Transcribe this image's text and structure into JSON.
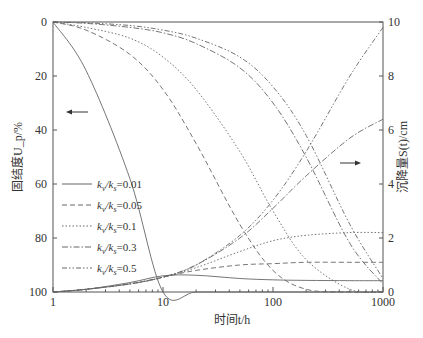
{
  "chart_data": {
    "type": "line",
    "title": "",
    "xlabel": "时间t/h",
    "ylabel_left": "固结度U_p/%",
    "ylabel_right": "沉降量S(t)/cm",
    "xscale": "log",
    "xlim": [
      1,
      1000
    ],
    "ylim_left": [
      100,
      0
    ],
    "ylim_right": [
      0,
      10
    ],
    "left_axis_inverted": true,
    "x_ticks": [
      "1",
      "10",
      "100",
      "1000"
    ],
    "y_left_ticks": [
      "0",
      "20",
      "40",
      "60",
      "80",
      "100"
    ],
    "y_right_ticks": [
      "0",
      "2",
      "4",
      "6",
      "8",
      "10"
    ],
    "grid": false,
    "legend_position": "left-middle",
    "annotations": [
      {
        "text": "←",
        "meaning": "left-pointing arrow: descending curves read on left axis (consolidation degree)"
      },
      {
        "text": "→",
        "meaning": "right-pointing arrow: rising curves read on right axis (settlement)"
      }
    ],
    "x": [
      1,
      2,
      5,
      10,
      20,
      50,
      100,
      200,
      500,
      1000
    ],
    "series": [
      {
        "name": "k_v/k_s=0.01",
        "axis": "left",
        "style": "solid",
        "values": [
          0,
          18,
          58,
          100,
          100,
          100,
          100,
          100,
          100,
          100
        ]
      },
      {
        "name": "k_v/k_s=0.05",
        "axis": "left",
        "style": "dashed",
        "values": [
          0,
          3,
          12,
          25,
          45,
          75,
          92,
          99,
          100,
          100
        ]
      },
      {
        "name": "k_v/k_s=0.1",
        "axis": "left",
        "style": "dotted",
        "values": [
          0,
          2,
          6,
          13,
          25,
          48,
          70,
          88,
          99,
          100
        ]
      },
      {
        "name": "k_v/k_s=0.3",
        "axis": "left",
        "style": "dash-dot",
        "values": [
          0,
          0.5,
          2,
          4,
          8,
          17,
          30,
          50,
          82,
          97
        ]
      },
      {
        "name": "k_v/k_s=0.5",
        "axis": "left",
        "style": "dash-dot-dot",
        "values": [
          0,
          0.3,
          1.3,
          3,
          6,
          13,
          24,
          42,
          75,
          95
        ]
      },
      {
        "name": "k_v/k_s=0.01 settlement",
        "axis": "right",
        "style": "solid",
        "values": [
          0,
          0.1,
          0.35,
          0.6,
          0.62,
          0.5,
          0.45,
          0.43,
          0.42,
          0.42
        ]
      },
      {
        "name": "k_v/k_s=0.05 settlement",
        "axis": "right",
        "style": "dashed",
        "values": [
          0,
          0.1,
          0.3,
          0.55,
          0.8,
          1.0,
          1.05,
          1.1,
          1.1,
          1.1
        ]
      },
      {
        "name": "k_v/k_s=0.1 settlement",
        "axis": "right",
        "style": "dotted",
        "values": [
          0,
          0.1,
          0.3,
          0.55,
          0.9,
          1.5,
          1.9,
          2.1,
          2.2,
          2.2
        ]
      },
      {
        "name": "k_v/k_s=0.3 settlement",
        "axis": "right",
        "style": "dash-dot",
        "values": [
          0,
          0.1,
          0.3,
          0.55,
          1.0,
          2.0,
          3.1,
          4.3,
          5.7,
          6.4
        ]
      },
      {
        "name": "k_v/k_s=0.5 settlement",
        "axis": "right",
        "style": "dash-dot-dot",
        "values": [
          0,
          0.1,
          0.3,
          0.55,
          1.0,
          2.1,
          3.4,
          5.2,
          8.0,
          9.8
        ]
      }
    ]
  },
  "legend": {
    "items": [
      {
        "prefix": "k",
        "sub1": "v",
        "mid": "/k",
        "sub2": "s",
        "suffix": "=0.01"
      },
      {
        "prefix": "k",
        "sub1": "v",
        "mid": "/k",
        "sub2": "s",
        "suffix": "=0.05"
      },
      {
        "prefix": "k",
        "sub1": "v",
        "mid": "/k",
        "sub2": "s",
        "suffix": "=0.1"
      },
      {
        "prefix": "k",
        "sub1": "v",
        "mid": "/k",
        "sub2": "s",
        "suffix": "=0.3"
      },
      {
        "prefix": "k",
        "sub1": "v",
        "mid": "/k",
        "sub2": "s",
        "suffix": "=0.5"
      }
    ]
  },
  "labels": {
    "xlabel": "时间t/h",
    "ylabel_left": "固结度U_p/%",
    "ylabel_right": "沉降量S(t)/cm"
  }
}
